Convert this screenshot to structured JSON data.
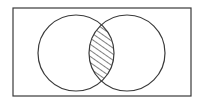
{
  "diagram": {
    "type": "venn",
    "title": "",
    "universe": {
      "x": 13,
      "y": 8,
      "width": 178,
      "height": 88
    },
    "sets": [
      {
        "name": "A",
        "cx": 76,
        "cy": 53,
        "r": 38
      },
      {
        "name": "B",
        "cx": 127,
        "cy": 53,
        "r": 38
      }
    ],
    "shaded_region": "A ∩ B",
    "shading_style": "diagonal-hatch",
    "colors": {
      "stroke": "#3a3a3a",
      "background": "#ffffff",
      "hatch": "#3a3a3a"
    },
    "labels": []
  }
}
